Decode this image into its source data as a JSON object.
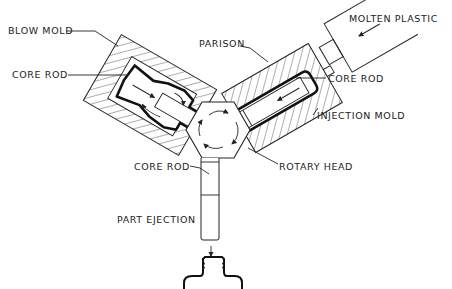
{
  "diagram": {
    "labels": {
      "blow_mold": "BLOW MOLD",
      "core_rod_left": "CORE ROD",
      "parison": "PARISON",
      "molten_plastic": "MOLTEN PLASTIC",
      "core_rod_right": "CORE ROD",
      "injection_mold": "INJECTION MOLD",
      "rotary_head": "ROTARY HEAD",
      "core_rod_bottom": "CORE ROD",
      "part_ejection": "PART EJECTION"
    },
    "stations": [
      "Injection",
      "Blow",
      "Ejection"
    ],
    "colors": {
      "ink": "#222222",
      "background": "#ffffff"
    }
  }
}
